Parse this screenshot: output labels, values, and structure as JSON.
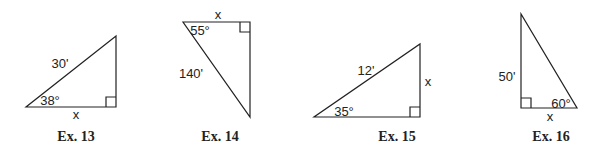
{
  "figures": [
    {
      "caption": "Ex. 13",
      "hypotenuse": "30'",
      "angle": "38°",
      "unknown": "x"
    },
    {
      "caption": "Ex. 14",
      "hypotenuse": "140'",
      "angle": "55°",
      "unknown": "x"
    },
    {
      "caption": "Ex. 15",
      "hypotenuse": "12'",
      "angle": "35°",
      "unknown": "x"
    },
    {
      "caption": "Ex. 16",
      "side": "50'",
      "angle": "60°",
      "unknown": "x"
    }
  ]
}
